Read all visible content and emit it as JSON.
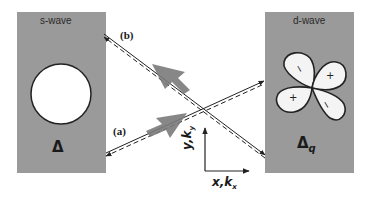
{
  "colors": {
    "panel_fill": "#9a9a9a",
    "line": "#222222",
    "arrow_fill": "#7a7a7a",
    "lobe_fill": "#f4f4f4",
    "background": "#ffffff"
  },
  "left_panel": {
    "title": "s-wave",
    "gap_symbol": "Δ",
    "shape": "circle"
  },
  "right_panel": {
    "title": "d-wave",
    "gap_symbol": "Δ",
    "gap_subscript": "q",
    "lobes": [
      {
        "position": "upper-left",
        "sign": "−"
      },
      {
        "position": "upper-right",
        "sign": "+"
      },
      {
        "position": "lower-left",
        "sign": "+"
      },
      {
        "position": "lower-right",
        "sign": "−"
      }
    ]
  },
  "paths": {
    "a": {
      "label": "(a)"
    },
    "b": {
      "label": "(b)"
    }
  },
  "axes": {
    "y_label": "y,k",
    "y_sub": "y",
    "x_label": "x,k",
    "x_sub": "x"
  }
}
